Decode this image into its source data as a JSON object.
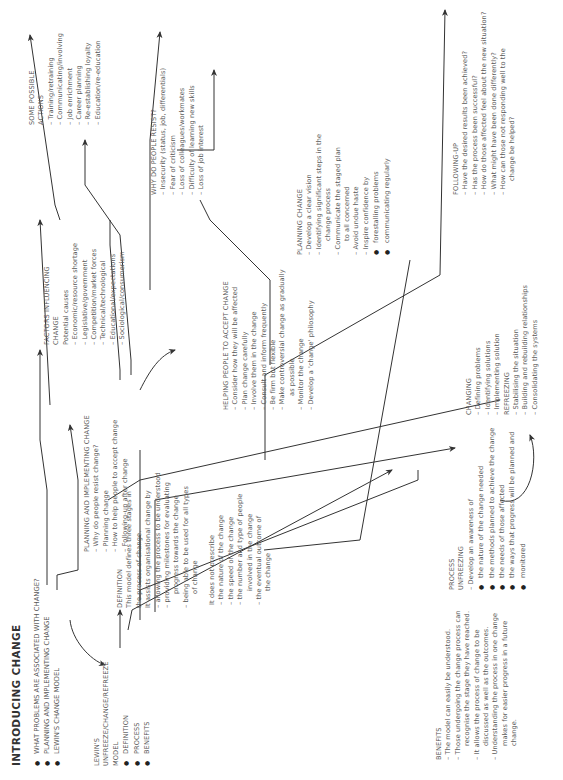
{
  "title": "INTRODUCING CHANGE",
  "main_topics": [
    "WHAT PROBLEMS ARE ASSOCIATED WITH CHANGE?",
    "PLANNING AND IMPLEMENTING CHANGE",
    "LEWIN'S CHANGE MODEL"
  ],
  "lewin": {
    "heading": [
      "LEWIN'S",
      "UNFREEZE/CHANGE/REFREEZE",
      "MODEL"
    ],
    "bullets": [
      "DEFINITION",
      "PROCESS",
      "BENEFITS"
    ]
  },
  "definition": {
    "heading": "DEFINITION",
    "lines": [
      "This model  defines three stages in",
      "the process of change.",
      "It assists organisational change by",
      "– allowing the process to be understood",
      "– providing milestones for evaluating",
      "progress towards the change",
      "– being able to be used for all types",
      "of change"
    ]
  },
  "not_prescribe": {
    "heading": "It does not prescribe",
    "items": [
      "the nature of the change",
      "the speed of the change",
      "the number and type of people",
      "involved in the change",
      "the eventual outcome of",
      "the change"
    ]
  },
  "benefits": {
    "heading": "BENEFITS",
    "items": [
      "The model can easily be understood.",
      "Those undergoing the change process can",
      "recognise the stage they have reached.",
      "It allows the process of change to be",
      "discussed as well as the outcomes.",
      "Understanding the process in one change",
      "makes for easier progress in a future",
      "change."
    ]
  },
  "process": {
    "heading": "PROCESS",
    "unfreezing_label": "UNFREEZING",
    "awareness": "Develop an awareness of",
    "bullets": [
      "the nature of the change needed",
      "the methods planned to achieve the change",
      "the needs of those affected",
      "the ways that progress will be planned and",
      "monitored"
    ]
  },
  "changing": {
    "heading": "CHANGING",
    "items": [
      "Defining problems",
      "Identifying solutions",
      "Implementing solution"
    ],
    "refreezing_label": "REFREEZING",
    "refreezing_items": [
      "Stabilising the situation",
      "Building and rebuilding relationships",
      "Consolidating the systems"
    ]
  },
  "planning_implementing": {
    "heading": "PLANNING AND IMPLEMENTING CHANGE",
    "items": [
      "Why do people resist change?",
      "Planning change",
      "How to help people to accept change",
      "Following-up after change"
    ]
  },
  "helping": {
    "heading": "HELPING PEOPLE TO ACCEPT CHANGE",
    "items": [
      "Consider how they will be affected",
      "Plan change carefully",
      "Involve them in the change",
      "Consult and inform frequently",
      "Be firm but flexible",
      "Make controversial change as gradually",
      "as possible",
      "Monitor the change",
      "Develop a 'change' philosophy"
    ]
  },
  "planning_change": {
    "heading": "PLANNING CHANGE",
    "items": [
      "Develop a clear vision",
      "Identifying significant steps in the",
      "change process",
      "Communicate the staged plan",
      "to all concerned",
      "Avoid undue haste",
      "Inspire confidence by"
    ],
    "bullets": [
      "forestalling problems",
      "communicating regularly"
    ]
  },
  "following_up": {
    "heading": "FOLLOWING-UP",
    "items": [
      "Have the desired results been achieved?",
      "Has the process been successful?",
      "How do those affected feel about the new situation?",
      "What might have been done differently?",
      "How can those not responding well to the",
      "change be helped?"
    ]
  },
  "factors": {
    "heading": [
      "FACTORS INFLUENCING",
      "CHANGE"
    ],
    "subheading": "Potential causes",
    "items": [
      "Economic/resource shortage",
      "Legislative/government",
      "Competition/market forces",
      "Technical/technological",
      "Educational/expectations",
      "Sociological/consumerism"
    ]
  },
  "why_resist": {
    "heading": "WHY DO PEOPLE RESIST?",
    "items": [
      "Insecurity (status, job, differentials)",
      "Fear of criticism",
      "Loss of colleagues/workmates",
      "Difficulty of learning new skills",
      "Loss of job interest"
    ]
  },
  "actions": {
    "heading": [
      "SOME POSSIBLE",
      "ACTIONS"
    ],
    "items": [
      "Training/retraining",
      "Communicating/involving",
      "Job enrichment",
      "Career planning",
      "Re-establishing loyalty",
      "Education/re-education"
    ]
  },
  "colors": {
    "text": "#5a5a5a",
    "lines": "#333333",
    "background": "#ffffff"
  }
}
